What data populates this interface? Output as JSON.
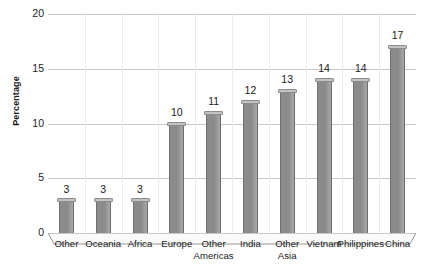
{
  "chart_data": {
    "type": "bar",
    "title": "",
    "subtitle": "",
    "xlabel": "",
    "ylabel": "Percentage",
    "ylim": [
      0,
      20
    ],
    "ytick_values": [
      0,
      5,
      10,
      15,
      20
    ],
    "ytick_labels": [
      "0",
      "5",
      "10",
      "15",
      "20"
    ],
    "grid": "horizontal",
    "legend": "none",
    "orientation": "vertical",
    "style": "3d-column-grayscale",
    "categories": [
      "Other",
      "Oceania",
      "Africa",
      "Europe",
      "Other Americas",
      "India",
      "Other Asia",
      "Vietnam",
      "Philippines",
      "China"
    ],
    "category_lines": [
      [
        "Other"
      ],
      [
        "Oceania"
      ],
      [
        "Africa"
      ],
      [
        "Europe"
      ],
      [
        "Other",
        "Americas"
      ],
      [
        "India"
      ],
      [
        "Other",
        "Asia"
      ],
      [
        "Vietnam"
      ],
      [
        "Philippines"
      ],
      [
        "China"
      ]
    ],
    "values": [
      3,
      3,
      3,
      10,
      11,
      12,
      13,
      14,
      14,
      17
    ],
    "data_labels": [
      "3",
      "3",
      "3",
      "10",
      "11",
      "12",
      "13",
      "14",
      "14",
      "17"
    ],
    "colors": {
      "bar_face": "#8a8a8a",
      "bar_top": "#c2c2c2",
      "bar_edge": "#6f6f6f",
      "gridline": "#c9c9c9",
      "axis": "#8f8f8f",
      "background": "#ffffff",
      "text": "#1a1a1a"
    }
  }
}
